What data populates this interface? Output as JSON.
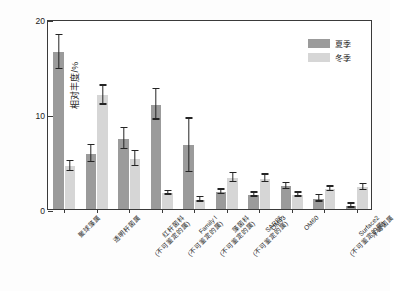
{
  "chart_data": {
    "type": "bar",
    "title": "",
    "xlabel": "",
    "ylabel": "相对丰度/%",
    "ylim": [
      0,
      20
    ],
    "yticks": [
      0,
      10,
      20
    ],
    "ytick_labels": [
      "0",
      "10",
      "20"
    ],
    "grid": false,
    "legend_position": "top-right",
    "categories": [
      "聚球藻属",
      "透明杆菌属",
      "红杆菌科\n(不可鉴定的属)",
      "Family I\n(不可鉴定的属)",
      "藻菌科\n(不可鉴定的属)",
      "SAR86\n(不可鉴定的属)",
      "OM43",
      "OM60",
      "Surface2\n(不可鉴定的属)",
      "浮霉菌属"
    ],
    "category_lines": [
      [
        "聚球藻属",
        ""
      ],
      [
        "透明杆菌属",
        ""
      ],
      [
        "红杆菌科",
        "(不可鉴定的属)"
      ],
      [
        "Family I",
        "(不可鉴定的属)"
      ],
      [
        "藻菌科",
        "(不可鉴定的属)"
      ],
      [
        "SAR86",
        "(不可鉴定的属)"
      ],
      [
        "OM43",
        ""
      ],
      [
        "OM60",
        ""
      ],
      [
        "Surface2",
        "(不可鉴定的属)"
      ],
      [
        "浮霉菌属",
        ""
      ]
    ],
    "series": [
      {
        "name": "夏季",
        "color": "#9b9b9b",
        "values": [
          16.5,
          5.8,
          7.4,
          11.0,
          6.7,
          1.8,
          1.5,
          2.4,
          1.1,
          0.35
        ],
        "err_low": [
          1.8,
          0.9,
          1.1,
          1.6,
          2.8,
          0.25,
          0.2,
          0.3,
          0.35,
          0.2
        ],
        "err_high": [
          1.8,
          0.9,
          1.1,
          1.6,
          2.8,
          0.25,
          0.2,
          0.3,
          0.35,
          0.2
        ]
      },
      {
        "name": "冬季",
        "color": "#d6d6d6",
        "values": [
          4.5,
          12.0,
          5.3,
          1.7,
          1.0,
          3.3,
          3.2,
          1.5,
          2.1,
          2.3
        ],
        "err_low": [
          0.55,
          1.0,
          0.8,
          0.2,
          0.25,
          0.45,
          0.4,
          0.2,
          0.25,
          0.3
        ],
        "err_high": [
          0.55,
          1.0,
          0.8,
          0.2,
          0.25,
          0.45,
          0.4,
          0.2,
          0.25,
          0.3
        ]
      }
    ]
  },
  "legend": {
    "items": [
      {
        "label": "夏季"
      },
      {
        "label": "冬季"
      }
    ]
  },
  "axes": {
    "y_title": "相对丰度/%"
  }
}
